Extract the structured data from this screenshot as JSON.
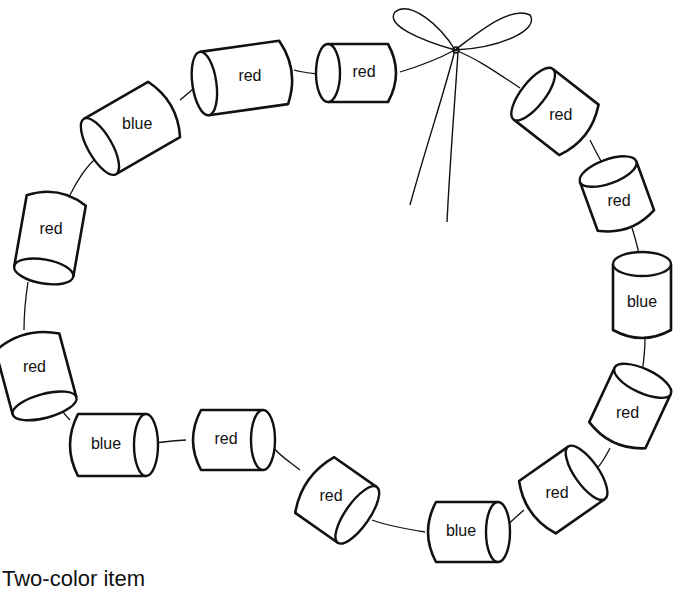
{
  "diagram": {
    "type": "bead-necklace",
    "bow": {
      "position": "top",
      "label": ""
    },
    "beads": [
      {
        "id": 1,
        "label": "red",
        "cx": 358,
        "cy": 73,
        "rot": 0,
        "w": 84,
        "h": 58
      },
      {
        "id": 2,
        "label": "red",
        "cx": 556,
        "cy": 112,
        "rot": 38,
        "w": 82,
        "h": 64
      },
      {
        "id": 3,
        "label": "red",
        "cx": 617,
        "cy": 196,
        "rot": 70,
        "w": 76,
        "h": 60
      },
      {
        "id": 4,
        "label": "blue",
        "cx": 642,
        "cy": 297,
        "rot": 90,
        "w": 90,
        "h": 58
      },
      {
        "id": 5,
        "label": "red",
        "cx": 630,
        "cy": 408,
        "rot": 115,
        "w": 84,
        "h": 62
      },
      {
        "id": 6,
        "label": "red",
        "cx": 562,
        "cy": 490,
        "rot": 145,
        "w": 84,
        "h": 64
      },
      {
        "id": 7,
        "label": "blue",
        "cx": 467,
        "cy": 532,
        "rot": 180,
        "w": 86,
        "h": 60
      },
      {
        "id": 8,
        "label": "red",
        "cx": 336,
        "cy": 500,
        "rot": 215,
        "w": 76,
        "h": 68
      },
      {
        "id": 9,
        "label": "red",
        "cx": 232,
        "cy": 440,
        "rot": 180,
        "w": 86,
        "h": 60
      },
      {
        "id": 10,
        "label": "blue",
        "cx": 112,
        "cy": 445,
        "rot": 180,
        "w": 92,
        "h": 62
      },
      {
        "id": 11,
        "label": "red",
        "cx": 36,
        "cy": 374,
        "rot": 255,
        "w": 90,
        "h": 66
      },
      {
        "id": 12,
        "label": "red",
        "cx": 50,
        "cy": 236,
        "rot": 280,
        "w": 96,
        "h": 60
      },
      {
        "id": 13,
        "label": "blue",
        "cx": 132,
        "cy": 128,
        "rot": 330,
        "w": 98,
        "h": 64
      },
      {
        "id": 14,
        "label": "red",
        "cx": 244,
        "cy": 78,
        "rot": 352,
        "w": 104,
        "h": 64
      }
    ],
    "counts": {
      "red": 10,
      "blue": 4,
      "total": 14
    }
  },
  "caption": {
    "text": "Two-color item"
  }
}
